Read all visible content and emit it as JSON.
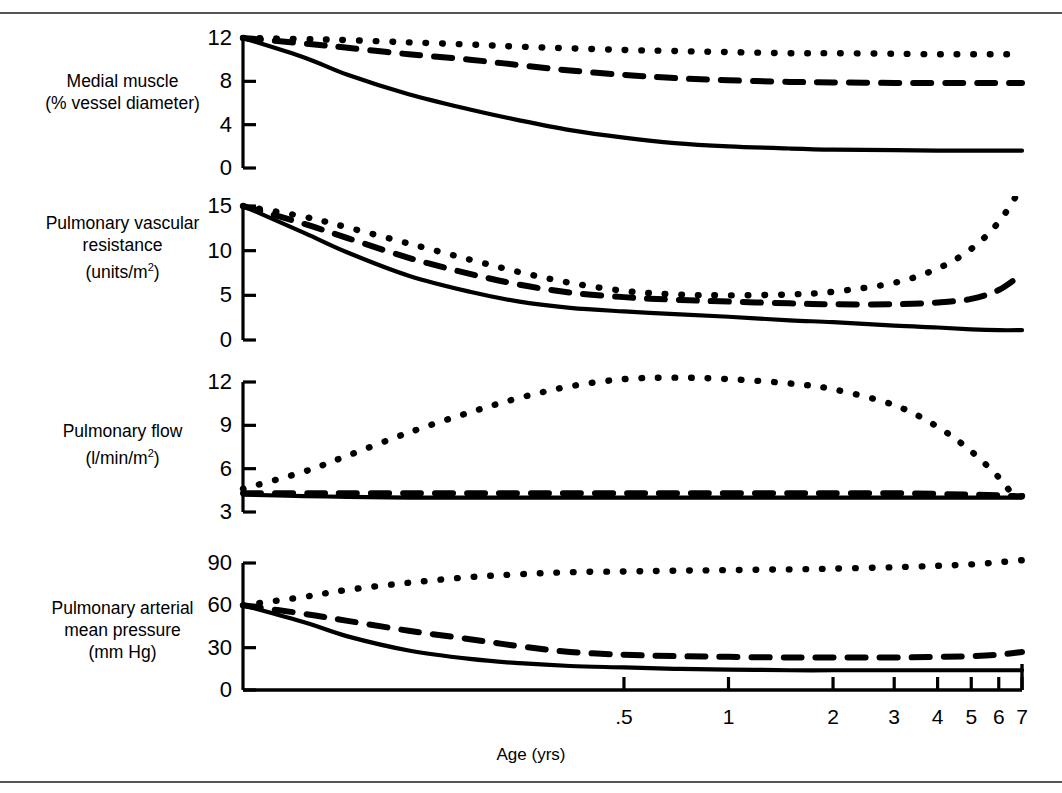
{
  "figure": {
    "xaxis_title": "Age (yrs)",
    "x_tick_labels": [
      ".5",
      "1",
      "2",
      "3",
      "4",
      "5",
      "6",
      "7"
    ],
    "x_tick_values": [
      0.5,
      1,
      2,
      3,
      4,
      5,
      6,
      7
    ],
    "line_styles": [
      "solid",
      "dashed",
      "dotted"
    ]
  },
  "panels": [
    {
      "label_line1": "Medial muscle",
      "label_line2": "(% vessel diameter)",
      "label_line3": "",
      "unit_sup": "",
      "y_ticks": [
        "0",
        "4",
        "8",
        "12"
      ]
    },
    {
      "label_line1": "Pulmonary vascular",
      "label_line2": "resistance",
      "label_line3": "(units/m",
      "unit_sup": "2",
      "y_ticks": [
        "0",
        "5",
        "10",
        "15"
      ]
    },
    {
      "label_line1": "Pulmonary flow",
      "label_line2": "(l/min/m",
      "label_line3": "",
      "unit_sup": "2",
      "y_ticks": [
        "3",
        "6",
        "9",
        "12"
      ]
    },
    {
      "label_line1": "Pulmonary arterial",
      "label_line2": "mean pressure",
      "label_line3": "(mm Hg)",
      "unit_sup": "",
      "y_ticks": [
        "0",
        "30",
        "60",
        "90"
      ]
    }
  ],
  "chart_data": [
    {
      "type": "line",
      "title": "Medial muscle (% vessel diameter)",
      "ylabel": "Medial muscle (% vessel diameter)",
      "xlabel": "Age (yrs)",
      "xscale": "log-like",
      "xlim": [
        0.04,
        7
      ],
      "ylim": [
        0,
        12
      ],
      "yticks": [
        0,
        4,
        8,
        12
      ],
      "grid": false,
      "legend": "none",
      "x": [
        0.04,
        0.06,
        0.08,
        0.12,
        0.18,
        0.25,
        0.35,
        0.5,
        0.7,
        1,
        1.5,
        2,
        3,
        4,
        5,
        6,
        7
      ],
      "series": [
        {
          "name": "solid",
          "style": "solid",
          "values": [
            12.0,
            10.2,
            8.6,
            6.8,
            5.4,
            4.4,
            3.5,
            2.8,
            2.3,
            2.0,
            1.8,
            1.7,
            1.65,
            1.6,
            1.6,
            1.6,
            1.6
          ]
        },
        {
          "name": "dashed",
          "style": "dashed",
          "values": [
            12.0,
            11.5,
            11.1,
            10.5,
            10.0,
            9.5,
            9.0,
            8.6,
            8.3,
            8.1,
            7.95,
            7.9,
            7.85,
            7.85,
            7.85,
            7.85,
            7.85
          ]
        },
        {
          "name": "dotted",
          "style": "dotted",
          "values": [
            12.0,
            11.9,
            11.8,
            11.6,
            11.4,
            11.2,
            11.05,
            10.9,
            10.8,
            10.7,
            10.6,
            10.6,
            10.55,
            10.5,
            10.5,
            10.5,
            10.5
          ]
        }
      ]
    },
    {
      "type": "line",
      "title": "Pulmonary vascular resistance (units/m2)",
      "ylabel": "Pulmonary vascular resistance (units/m2)",
      "xlabel": "Age (yrs)",
      "xscale": "log-like",
      "xlim": [
        0.04,
        7
      ],
      "ylim": [
        0,
        15
      ],
      "yticks": [
        0,
        5,
        10,
        15
      ],
      "grid": false,
      "legend": "none",
      "x": [
        0.04,
        0.06,
        0.08,
        0.12,
        0.18,
        0.25,
        0.35,
        0.5,
        0.7,
        1,
        1.5,
        2,
        3,
        4,
        5,
        6,
        7
      ],
      "series": [
        {
          "name": "solid",
          "style": "solid",
          "values": [
            15.0,
            12.0,
            9.8,
            7.2,
            5.4,
            4.3,
            3.6,
            3.2,
            2.9,
            2.6,
            2.2,
            2.0,
            1.6,
            1.4,
            1.2,
            1.1,
            1.1
          ]
        },
        {
          "name": "dashed",
          "style": "dashed",
          "values": [
            15.0,
            13.0,
            11.4,
            9.2,
            7.4,
            6.2,
            5.3,
            4.8,
            4.5,
            4.3,
            4.1,
            4.0,
            4.0,
            4.2,
            4.6,
            5.6,
            7.4
          ]
        },
        {
          "name": "dotted",
          "style": "dotted",
          "values": [
            15.0,
            13.8,
            12.6,
            10.8,
            9.0,
            7.6,
            6.4,
            5.5,
            5.1,
            5.0,
            5.1,
            5.4,
            6.4,
            8.0,
            10.2,
            13.2,
            17.2
          ]
        }
      ]
    },
    {
      "type": "line",
      "title": "Pulmonary flow (l/min/m2)",
      "ylabel": "Pulmonary flow (l/min/m2)",
      "xlabel": "Age (yrs)",
      "xscale": "log-like",
      "xlim": [
        0.04,
        7
      ],
      "ylim": [
        3,
        12.6
      ],
      "yticks": [
        3,
        6,
        9,
        12
      ],
      "grid": false,
      "legend": "none",
      "x": [
        0.04,
        0.06,
        0.08,
        0.12,
        0.18,
        0.25,
        0.35,
        0.5,
        0.7,
        1,
        1.5,
        2,
        3,
        4,
        5,
        6,
        6.6,
        7
      ],
      "series": [
        {
          "name": "solid",
          "style": "solid",
          "values": [
            4.2,
            4.1,
            4.05,
            4.0,
            4.0,
            4.0,
            4.0,
            4.0,
            4.0,
            4.0,
            4.0,
            4.0,
            4.0,
            4.0,
            4.0,
            4.0,
            4.0,
            4.0
          ]
        },
        {
          "name": "dashed",
          "style": "dashed",
          "values": [
            4.3,
            4.3,
            4.3,
            4.3,
            4.3,
            4.3,
            4.3,
            4.3,
            4.3,
            4.3,
            4.3,
            4.3,
            4.3,
            4.25,
            4.2,
            4.15,
            4.1,
            4.1
          ]
        },
        {
          "name": "dotted",
          "style": "dotted",
          "values": [
            4.6,
            5.8,
            6.9,
            8.5,
            9.9,
            10.9,
            11.7,
            12.2,
            12.3,
            12.2,
            11.9,
            11.5,
            10.4,
            8.9,
            7.2,
            5.4,
            4.2,
            4.1
          ]
        }
      ]
    },
    {
      "type": "line",
      "title": "Pulmonary arterial mean pressure (mm Hg)",
      "ylabel": "Pulmonary arterial mean pressure (mm Hg)",
      "xlabel": "Age (yrs)",
      "xscale": "log-like",
      "xlim": [
        0.04,
        7
      ],
      "ylim": [
        0,
        95
      ],
      "yticks": [
        0,
        30,
        60,
        90
      ],
      "grid": false,
      "legend": "none",
      "x": [
        0.04,
        0.06,
        0.08,
        0.12,
        0.18,
        0.25,
        0.35,
        0.5,
        0.7,
        1,
        1.5,
        2,
        3,
        4,
        5,
        6,
        7
      ],
      "series": [
        {
          "name": "solid",
          "style": "solid",
          "values": [
            60,
            48,
            38,
            28,
            22,
            19,
            17,
            16,
            15,
            14.5,
            14,
            14,
            14,
            14,
            14,
            14,
            14
          ]
        },
        {
          "name": "dashed",
          "style": "dashed",
          "values": [
            60,
            54,
            49,
            42,
            36,
            31,
            27,
            25,
            24,
            23.5,
            23,
            23,
            23,
            23.5,
            24,
            25,
            27
          ]
        },
        {
          "name": "dotted",
          "style": "dotted",
          "values": [
            60,
            66,
            71,
            76,
            80,
            82,
            83.5,
            84,
            84.5,
            85,
            85.5,
            86,
            87,
            88,
            89,
            90.5,
            92
          ]
        }
      ]
    }
  ]
}
